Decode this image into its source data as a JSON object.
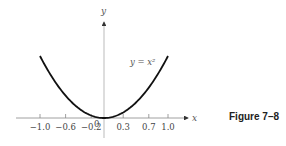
{
  "caption": "Figure 7–8",
  "chart_data": {
    "type": "line",
    "title": "",
    "xlabel": "x",
    "ylabel": "y",
    "x_ticks": [
      -1.0,
      -0.6,
      -0.2,
      0.3,
      0.7,
      1.0
    ],
    "x_tick_labels": [
      "−1.0",
      "−0.6",
      "−0.2",
      "0.3",
      "0.7",
      "1.0"
    ],
    "origin_label": "0",
    "series": [
      {
        "name": "y = x²",
        "function": "x^2",
        "x": [
          -1.0,
          -0.8,
          -0.6,
          -0.4,
          -0.2,
          0.0,
          0.2,
          0.4,
          0.6,
          0.8,
          1.0
        ],
        "values": [
          1.0,
          0.64,
          0.36,
          0.16,
          0.04,
          0.0,
          0.04,
          0.16,
          0.36,
          0.64,
          1.0
        ]
      }
    ],
    "annotations": [
      {
        "text": "y = x²",
        "near_x": 0.55,
        "near_y": 0.75
      }
    ],
    "xlim": [
      -1.1,
      1.2
    ],
    "ylim": [
      0,
      1.3
    ],
    "grid": false,
    "legend": "none"
  }
}
